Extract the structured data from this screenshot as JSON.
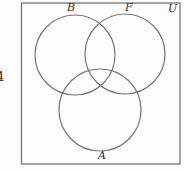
{
  "figure": {
    "type": "venn-diagram",
    "problem_number": "4",
    "universal_set_label": "U",
    "circles": [
      {
        "id": "top-left",
        "label": "B"
      },
      {
        "id": "top-right",
        "label": "F"
      },
      {
        "id": "bottom",
        "label": "A"
      }
    ]
  },
  "colors": {
    "stroke": "#757575",
    "text": "#2f2f2f",
    "background": "#fdfdfc"
  }
}
